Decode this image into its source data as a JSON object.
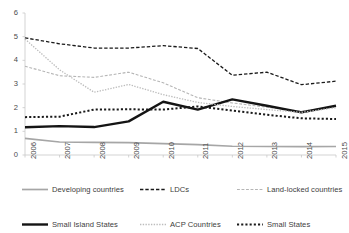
{
  "chart_data": {
    "type": "line",
    "title": "",
    "xlabel": "",
    "ylabel": "",
    "categories": [
      "2006",
      "2007",
      "2008",
      "2009",
      "2010",
      "2011",
      "2012",
      "2013",
      "2014",
      "2015"
    ],
    "x": [
      2006,
      2007,
      2008,
      2009,
      2010,
      2011,
      2012,
      2013,
      2014,
      2015
    ],
    "ylim": [
      0,
      6
    ],
    "yticks": [
      0,
      1,
      2,
      3,
      4,
      5,
      6
    ],
    "grid": false,
    "legend_position": "bottom",
    "series": [
      {
        "name": "Developing countries",
        "style": "solid",
        "color": "#a6a6a6",
        "width": 1.7,
        "values": [
          0.7,
          0.55,
          0.53,
          0.52,
          0.48,
          0.44,
          0.37,
          0.36,
          0.35,
          0.36
        ]
      },
      {
        "name": "LDCs",
        "style": "dashed",
        "color": "#1a1a1a",
        "width": 1.3,
        "values": [
          4.95,
          4.7,
          4.52,
          4.52,
          4.62,
          4.5,
          3.37,
          3.5,
          2.97,
          3.12
        ]
      },
      {
        "name": "Land-locked countries",
        "style": "dashed",
        "color": "#b5b5b5",
        "width": 1.1,
        "values": [
          3.75,
          3.35,
          3.28,
          3.5,
          3.05,
          2.42,
          2.2,
          2.02,
          1.85,
          2.05
        ]
      },
      {
        "name": "Small Island States",
        "style": "solid",
        "color": "#141414",
        "width": 2.4,
        "values": [
          1.17,
          1.22,
          1.18,
          1.42,
          2.25,
          1.92,
          2.35,
          2.08,
          1.8,
          2.08
        ]
      },
      {
        "name": "ACP Countries",
        "style": "dotted",
        "color": "#bcbcbc",
        "width": 1.3,
        "values": [
          4.9,
          3.6,
          2.65,
          2.98,
          2.55,
          2.22,
          2.05,
          1.92,
          1.8,
          2.0
        ]
      },
      {
        "name": "Small States",
        "style": "dotted",
        "color": "#1a1a1a",
        "width": 2.0,
        "values": [
          1.6,
          1.62,
          1.92,
          1.93,
          1.92,
          2.05,
          1.88,
          1.7,
          1.55,
          1.52
        ]
      }
    ]
  },
  "axes": {
    "y_tick_labels": [
      "6",
      "5",
      "4",
      "3",
      "2",
      "1",
      "0"
    ],
    "x_tick_labels": [
      "2006",
      "2007",
      "2008",
      "2009",
      "2010",
      "2011",
      "2012",
      "2013",
      "2014",
      "2015"
    ]
  },
  "legend": {
    "rows": [
      [
        {
          "label": "Developing countries",
          "series": 0
        },
        {
          "label": "LDCs",
          "series": 1
        },
        {
          "label": "Land-locked countries",
          "series": 2
        }
      ],
      [
        {
          "label": "Small Island States",
          "series": 3
        },
        {
          "label": "ACP Countries",
          "series": 4
        },
        {
          "label": "Small States",
          "series": 5
        }
      ]
    ]
  }
}
